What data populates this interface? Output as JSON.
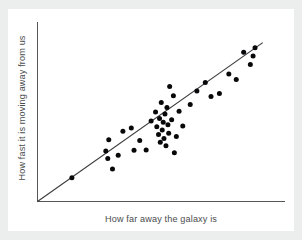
{
  "figure": {
    "panel_background": "#ffffff",
    "frame_background": "#eceded",
    "axis_color": "#555759",
    "line_color": "#3a3c3e",
    "point_color": "#08080a"
  },
  "chart_data": {
    "type": "scatter",
    "title": "",
    "subtitle": "",
    "xlabel": "How far away the galaxy is",
    "ylabel": "How fast it is moving away from us",
    "xtick_labels": [],
    "ytick_labels": [],
    "grid": false,
    "legend": null,
    "xlim": [
      0,
      100
    ],
    "ylim": [
      0,
      100
    ],
    "annotations": [],
    "series": [
      {
        "name": "galaxies",
        "marker": "filled-circle",
        "color": "#08080a",
        "points": [
          {
            "x": 13.9,
            "y": 13.3
          },
          {
            "x": 27.6,
            "y": 28.2
          },
          {
            "x": 28.4,
            "y": 24.0
          },
          {
            "x": 28.8,
            "y": 34.4
          },
          {
            "x": 30.3,
            "y": 18.1
          },
          {
            "x": 32.6,
            "y": 25.8
          },
          {
            "x": 34.5,
            "y": 39.1
          },
          {
            "x": 37.9,
            "y": 41.0
          },
          {
            "x": 39.0,
            "y": 28.5
          },
          {
            "x": 41.3,
            "y": 34.0
          },
          {
            "x": 43.9,
            "y": 28.7
          },
          {
            "x": 45.9,
            "y": 44.9
          },
          {
            "x": 47.7,
            "y": 49.8
          },
          {
            "x": 48.2,
            "y": 41.6
          },
          {
            "x": 48.9,
            "y": 37.3
          },
          {
            "x": 49.3,
            "y": 46.2
          },
          {
            "x": 49.6,
            "y": 33.0
          },
          {
            "x": 50.0,
            "y": 55.2
          },
          {
            "x": 50.4,
            "y": 39.9
          },
          {
            "x": 50.8,
            "y": 44.2
          },
          {
            "x": 51.1,
            "y": 35.1
          },
          {
            "x": 51.5,
            "y": 48.7
          },
          {
            "x": 51.9,
            "y": 31.0
          },
          {
            "x": 52.3,
            "y": 52.4
          },
          {
            "x": 52.7,
            "y": 42.8
          },
          {
            "x": 53.0,
            "y": 38.0
          },
          {
            "x": 53.4,
            "y": 64.1
          },
          {
            "x": 54.2,
            "y": 45.5
          },
          {
            "x": 54.9,
            "y": 58.9
          },
          {
            "x": 55.3,
            "y": 27.1
          },
          {
            "x": 56.1,
            "y": 36.2
          },
          {
            "x": 57.2,
            "y": 50.3
          },
          {
            "x": 58.7,
            "y": 42.1
          },
          {
            "x": 61.7,
            "y": 54.0
          },
          {
            "x": 64.4,
            "y": 61.5
          },
          {
            "x": 67.8,
            "y": 66.3
          },
          {
            "x": 70.1,
            "y": 58.5
          },
          {
            "x": 73.5,
            "y": 60.2
          },
          {
            "x": 77.3,
            "y": 71.0
          },
          {
            "x": 80.3,
            "y": 68.0
          },
          {
            "x": 83.3,
            "y": 83.2
          },
          {
            "x": 86.0,
            "y": 76.3
          },
          {
            "x": 87.1,
            "y": 81.0
          },
          {
            "x": 87.9,
            "y": 85.6
          }
        ]
      }
    ],
    "trend_line": {
      "name": "best-fit line",
      "from": {
        "x": 0,
        "y": 0
      },
      "to": {
        "x": 91.0,
        "y": 88.5
      },
      "color": "#3a3c3e"
    }
  }
}
